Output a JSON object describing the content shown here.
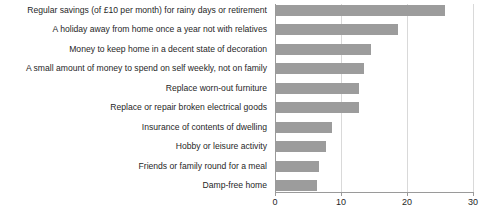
{
  "chart_data": {
    "type": "bar",
    "orientation": "horizontal",
    "title": "",
    "xlabel": "",
    "ylabel": "",
    "xlim": [
      0,
      30
    ],
    "xticks": [
      0,
      10,
      20,
      30
    ],
    "grid": true,
    "legend": "none",
    "bar_color": "#9c9c9c",
    "axis_color": "#9a9a9a",
    "gridline_color": "#d9d9d9",
    "categories": [
      "Regular savings (of £10 per month) for rainy days or retirement",
      "A holiday away from home once a year not with relatives",
      "Money to keep home in a decent state of decoration",
      "A small amount of money to spend on self weekly, not on family",
      "Replace worn-out furniture",
      "Replace or repair broken electrical goods",
      "Insurance of contents of dwelling",
      "Hobby or leisure activity",
      "Friends or family round for a meal",
      "Damp-free home"
    ],
    "values": [
      25.6,
      18.5,
      14.4,
      13.3,
      12.6,
      12.6,
      8.5,
      7.6,
      6.5,
      6.2
    ]
  }
}
